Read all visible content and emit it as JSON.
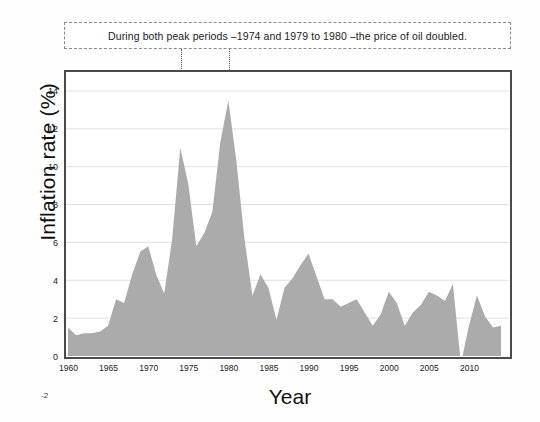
{
  "annotation": {
    "text": "During both peak periods –1974 and 1979 to 1980 –the price of oil doubled."
  },
  "chart_data": {
    "type": "area",
    "title": "",
    "xlabel": "Year",
    "ylabel": "Inflation rate (%)",
    "xlim": [
      1960,
      2014
    ],
    "ylim": [
      0,
      15
    ],
    "ytick_labels": [
      "0",
      "2",
      "4",
      "6",
      "8",
      "10",
      "12",
      "14"
    ],
    "ytick_values": [
      0,
      2,
      4,
      6,
      8,
      10,
      12,
      14
    ],
    "xtick_labels": [
      "1960",
      "1965",
      "1970",
      "1975",
      "1980",
      "1985",
      "1990",
      "1995",
      "2000",
      "2005",
      "2010"
    ],
    "xtick_values": [
      1960,
      1965,
      1970,
      1975,
      1980,
      1985,
      1990,
      1995,
      2000,
      2005,
      2010
    ],
    "extra_tick_label": "-2",
    "grid": true,
    "legend": "none",
    "series": [
      {
        "name": "Inflation rate",
        "fill_color": "#ababab",
        "x": [
          1960,
          1961,
          1962,
          1963,
          1964,
          1965,
          1966,
          1967,
          1968,
          1969,
          1970,
          1971,
          1972,
          1973,
          1974,
          1975,
          1976,
          1977,
          1978,
          1979,
          1980,
          1981,
          1982,
          1983,
          1984,
          1985,
          1986,
          1987,
          1988,
          1989,
          1990,
          1991,
          1992,
          1993,
          1994,
          1995,
          1996,
          1997,
          1998,
          1999,
          2000,
          2001,
          2002,
          2003,
          2004,
          2005,
          2006,
          2007,
          2008,
          2009,
          2010,
          2011,
          2012,
          2013,
          2014
        ],
        "values": [
          1.5,
          1.1,
          1.2,
          1.2,
          1.3,
          1.6,
          3.0,
          2.8,
          4.3,
          5.5,
          5.8,
          4.3,
          3.3,
          6.2,
          11.0,
          9.1,
          5.8,
          6.5,
          7.6,
          11.3,
          13.5,
          10.3,
          6.2,
          3.2,
          4.3,
          3.6,
          1.9,
          3.6,
          4.1,
          4.8,
          5.4,
          4.2,
          3.0,
          3.0,
          2.6,
          2.8,
          3.0,
          2.3,
          1.6,
          2.2,
          3.4,
          2.8,
          1.6,
          2.3,
          2.7,
          3.4,
          3.2,
          2.9,
          3.8,
          -0.4,
          1.6,
          3.2,
          2.1,
          1.5,
          1.6
        ]
      }
    ],
    "annotations": [
      {
        "label": "1974 peak marker",
        "x": 1974,
        "y": 11.0,
        "marker": "triangle-down"
      },
      {
        "label": "1980 peak marker",
        "x": 1980,
        "y": 13.5,
        "marker": "triangle-down"
      }
    ]
  }
}
